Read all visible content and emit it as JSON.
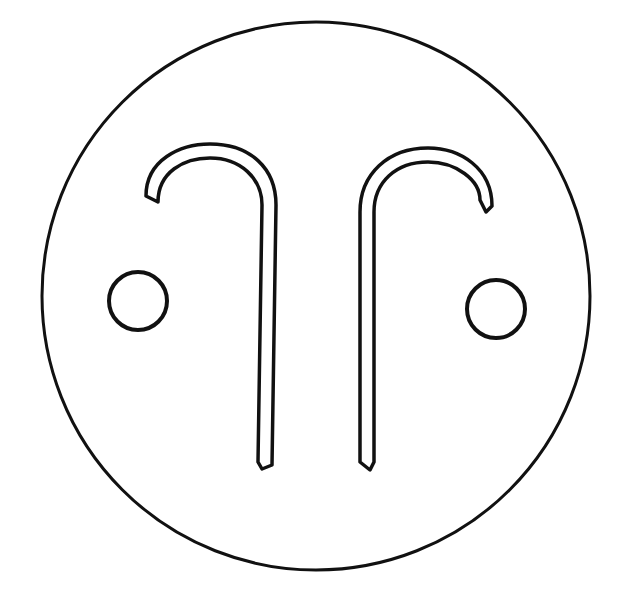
{
  "figure": {
    "title": "",
    "stroke_color": "#111111",
    "background_color": "#ffffff",
    "fill_color": "#ffffff"
  },
  "shapes": {
    "outer_circle": {
      "cx": 316,
      "cy": 296,
      "r": 274
    },
    "left_dot": {
      "cx": 138,
      "cy": 301,
      "r": 29
    },
    "right_dot": {
      "cx": 496,
      "cy": 309,
      "r": 29
    },
    "left_hook": {
      "orientation": "hook opens left, shaft on right"
    },
    "right_hook": {
      "orientation": "hook opens right, shaft on left"
    }
  }
}
